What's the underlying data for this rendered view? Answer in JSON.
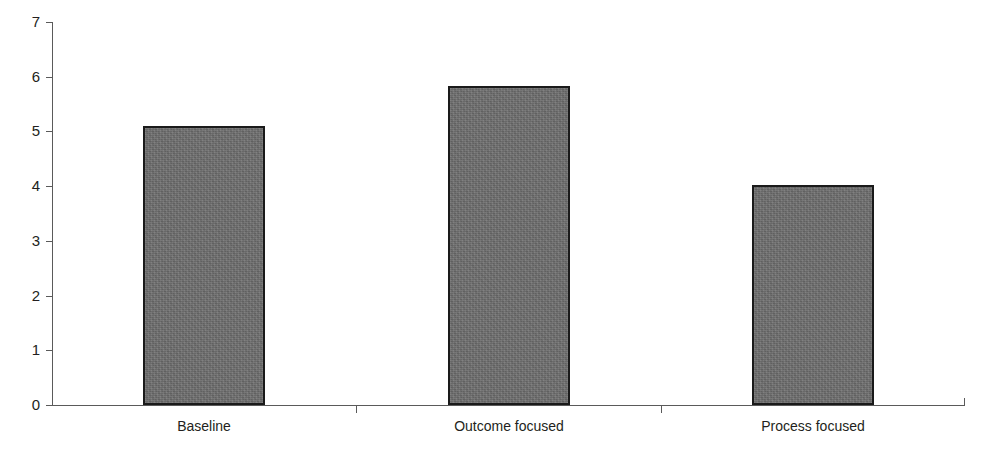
{
  "chart_data": {
    "type": "bar",
    "title": "",
    "subtitle": "",
    "xlabel": "",
    "ylabel": "",
    "categories": [
      "Baseline",
      "Outcome focused",
      "Process focused"
    ],
    "values": [
      5.1,
      5.83,
      4.02
    ],
    "series": [
      {
        "name": "",
        "values": [
          5.1,
          5.83,
          4.02
        ]
      }
    ],
    "ylim": [
      0,
      7
    ],
    "yticks": [
      0,
      1,
      2,
      3,
      4,
      5,
      6,
      7
    ],
    "ytick_labels": [
      "0",
      "1",
      "2",
      "3",
      "4",
      "5",
      "6",
      "7"
    ],
    "grid": false,
    "legend": false,
    "legend_position": "none",
    "annotations": [],
    "bar_fill_color": "#6e6e6e",
    "bar_border_color": "#1a1a1a",
    "axis_color": "#5a5a5a",
    "background_color": "#ffffff",
    "text_color": "#231f20"
  }
}
